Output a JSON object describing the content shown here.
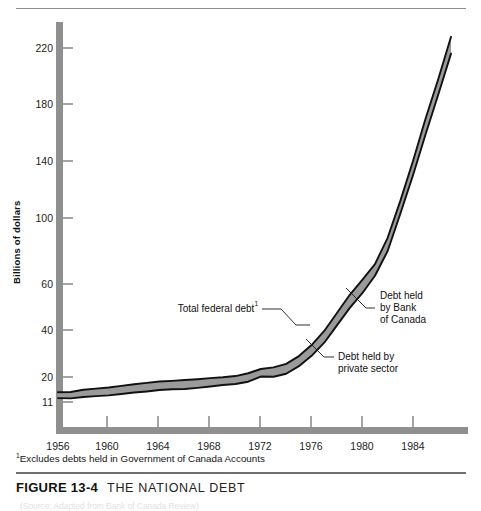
{
  "figure": {
    "caption_number": "FIGURE 13-4",
    "caption_title": "THE NATIONAL DEBT",
    "footnote": "Excludes debts held in Government of Canada Accounts",
    "footnote_marker": "1",
    "source_line": "(Source: Adapted from Bank of Canada Review)"
  },
  "chart_data": {
    "type": "area",
    "title": "THE NATIONAL DEBT",
    "subtitle": "",
    "xlabel": "",
    "ylabel": "Billions of dollars",
    "grid": false,
    "legend_position": "inline-annotations",
    "xlim": [
      1956,
      1987
    ],
    "ylim": [
      11,
      232
    ],
    "ytick_labels": [
      "11",
      "20",
      "40",
      "60",
      "100",
      "140",
      "180",
      "220"
    ],
    "ytick_values": [
      11,
      20,
      40,
      60,
      100,
      140,
      180,
      220
    ],
    "xtick_labels": [
      "1956",
      "1960",
      "1964",
      "1968",
      "1972",
      "1976",
      "1980",
      "1984"
    ],
    "xtick_values": [
      1956,
      1960,
      1964,
      1968,
      1972,
      1976,
      1980,
      1984
    ],
    "x": [
      1956,
      1957,
      1958,
      1959,
      1960,
      1961,
      1962,
      1963,
      1964,
      1965,
      1966,
      1967,
      1968,
      1969,
      1970,
      1971,
      1972,
      1973,
      1974,
      1975,
      1976,
      1977,
      1978,
      1979,
      1980,
      1981,
      1982,
      1983,
      1984,
      1985,
      1986,
      1987
    ],
    "series": [
      {
        "name": "Total federal debt",
        "annotation": "Total federal debt",
        "values": [
          14.5,
          14.6,
          15.4,
          15.8,
          16.2,
          16.8,
          17.4,
          17.9,
          18.4,
          18.6,
          18.9,
          19.2,
          19.6,
          19.9,
          20.4,
          21.6,
          23.4,
          24.1,
          25.6,
          28.9,
          33.6,
          39.6,
          47.4,
          55.2,
          62.5,
          72.0,
          88.0,
          112.0,
          140.0,
          170.0,
          198.0,
          228.0
        ]
      },
      {
        "name": "Debt held by private sector",
        "annotation": "Debt held by private sector",
        "values": [
          12.4,
          12.3,
          12.8,
          13.1,
          13.4,
          13.9,
          14.4,
          14.8,
          15.3,
          15.6,
          15.7,
          16.1,
          16.6,
          17.1,
          17.5,
          18.3,
          20.2,
          20.1,
          21.4,
          24.6,
          29.0,
          34.6,
          42.0,
          49.5,
          56.0,
          65.0,
          80.0,
          103.0,
          130.0,
          159.0,
          187.0,
          216.0
        ]
      }
    ],
    "band_label": "Debt held by Bank of Canada",
    "annotations": [
      {
        "id": "total-federal-debt",
        "text": "Total federal debt",
        "superscript": "1"
      },
      {
        "id": "debt-held-by-bank-of-canada",
        "lines": [
          "Debt held",
          "by Bank",
          "of Canada"
        ]
      },
      {
        "id": "debt-held-by-private-sector",
        "lines": [
          "Debt held by",
          "private sector"
        ]
      }
    ],
    "colors": {
      "band": "#9a9a9a",
      "line": "#111111",
      "axis": "#8f8f8f"
    }
  }
}
